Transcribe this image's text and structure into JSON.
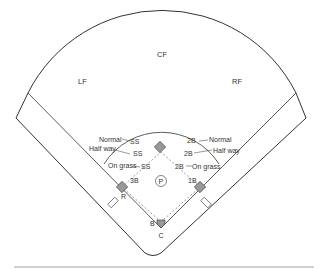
{
  "diagram": {
    "outfield": {
      "lf": "LF",
      "cf": "CF",
      "rf": "RF"
    },
    "infield": {
      "pitcher": "P",
      "catcher": "C",
      "batter": "B",
      "runner": "R",
      "first_base": "1B",
      "third_base": "3B"
    },
    "shortstop_positions": [
      {
        "depth": "Normal",
        "label": "SS"
      },
      {
        "depth": "Half way",
        "label": "SS"
      },
      {
        "depth": "On grass",
        "label": "SS"
      }
    ],
    "second_base_positions": [
      {
        "depth": "Normal",
        "label": "2B"
      },
      {
        "depth": "Half way",
        "label": "2B"
      },
      {
        "depth": "On grass",
        "label": "2B"
      }
    ],
    "colors": {
      "line": "#333333",
      "base_fill": "#999999",
      "background": "#ffffff"
    }
  }
}
